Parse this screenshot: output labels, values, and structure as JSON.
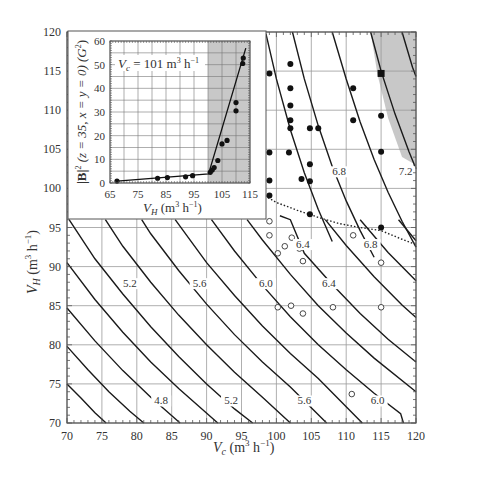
{
  "chart_data": [
    {
      "type": "line",
      "role": "main",
      "title": "",
      "xlabel": "V_c (m^3 h^-1)",
      "ylabel": "V_H (m^3 h^-1)",
      "xlim": [
        70,
        120
      ],
      "ylim": [
        70,
        120
      ],
      "xticks": [
        70,
        75,
        80,
        85,
        90,
        95,
        100,
        105,
        110,
        115,
        120
      ],
      "yticks": [
        70,
        75,
        80,
        85,
        90,
        95,
        100,
        105,
        110,
        115,
        120
      ],
      "grid": true,
      "contour_labels": [
        {
          "text": "4.8",
          "x": 83.5,
          "y": 72.5
        },
        {
          "text": "5.2",
          "x": 93.5,
          "y": 72.5
        },
        {
          "text": "5.6",
          "x": 104,
          "y": 72.5
        },
        {
          "text": "6.0",
          "x": 114.5,
          "y": 72.5
        },
        {
          "text": "5.2",
          "x": 79,
          "y": 87.5
        },
        {
          "text": "5.6",
          "x": 89,
          "y": 87.5
        },
        {
          "text": "6.0",
          "x": 98.5,
          "y": 87.5
        },
        {
          "text": "6.4",
          "x": 107.5,
          "y": 87.5
        },
        {
          "text": "6.4",
          "x": 103.8,
          "y": 92.5
        },
        {
          "text": "6.8",
          "x": 113.5,
          "y": 92.5
        },
        {
          "text": "6.8",
          "x": 109,
          "y": 101.8
        },
        {
          "text": "7.2",
          "x": 118.5,
          "y": 101.8
        }
      ],
      "contours": [
        [
          [
            70,
            75
          ],
          [
            72,
            73.2
          ],
          [
            74,
            71.3
          ],
          [
            75.6,
            70
          ]
        ],
        [
          [
            70,
            79.8
          ],
          [
            73,
            76.8
          ],
          [
            76,
            74
          ],
          [
            79,
            71.5
          ],
          [
            81,
            70
          ]
        ],
        [
          [
            70,
            84.7
          ],
          [
            74,
            80.5
          ],
          [
            78,
            76.7
          ],
          [
            82,
            73.3
          ],
          [
            86.2,
            70
          ]
        ],
        [
          [
            70,
            90.5
          ],
          [
            74,
            85.8
          ],
          [
            78,
            81.6
          ],
          [
            82,
            77.8
          ],
          [
            86,
            74.4
          ],
          [
            91.6,
            70
          ]
        ],
        [
          [
            70.3,
            96
          ],
          [
            74,
            91
          ],
          [
            78,
            86.5
          ],
          [
            82,
            82.3
          ],
          [
            86,
            78.5
          ],
          [
            90,
            75
          ],
          [
            94,
            71.8
          ],
          [
            96.6,
            70
          ]
        ],
        [
          [
            75.5,
            96
          ],
          [
            78,
            92.6
          ],
          [
            82,
            88
          ],
          [
            86,
            83.8
          ],
          [
            90,
            80
          ],
          [
            94,
            76.5
          ],
          [
            98,
            73.3
          ],
          [
            102,
            70
          ]
        ],
        [
          [
            80.7,
            96
          ],
          [
            82,
            94.2
          ],
          [
            86,
            89.5
          ],
          [
            90,
            85.2
          ],
          [
            94,
            81.3
          ],
          [
            98,
            77.8
          ],
          [
            102,
            74.6
          ],
          [
            107.2,
            70
          ]
        ],
        [
          [
            85.5,
            96
          ],
          [
            90,
            90.5
          ],
          [
            94,
            86.3
          ],
          [
            98,
            82.4
          ],
          [
            102,
            78.9
          ],
          [
            106,
            75.7
          ],
          [
            112.3,
            70
          ]
        ],
        [
          [
            90.7,
            96
          ],
          [
            94,
            92
          ],
          [
            98,
            87.6
          ],
          [
            102,
            83.6
          ],
          [
            106,
            80
          ],
          [
            110,
            76.8
          ],
          [
            114,
            73.8
          ],
          [
            117.8,
            71.2
          ],
          [
            118.2,
            70
          ]
        ],
        [
          [
            95.8,
            96
          ],
          [
            98,
            93.4
          ],
          [
            102,
            89
          ],
          [
            106,
            85
          ],
          [
            110,
            81.5
          ],
          [
            114,
            78.3
          ],
          [
            120,
            74
          ]
        ],
        [
          [
            100.5,
            96.5
          ],
          [
            102,
            96
          ],
          [
            104,
            91.7
          ],
          [
            108,
            87.7
          ],
          [
            112,
            84
          ],
          [
            116,
            80.7
          ],
          [
            120,
            77.8
          ]
        ],
        [
          [
            107,
            96
          ],
          [
            110,
            92.7
          ],
          [
            114,
            88.7
          ],
          [
            118,
            85.1
          ],
          [
            120,
            83.5
          ]
        ],
        [
          [
            112,
            96
          ],
          [
            116,
            91.8
          ],
          [
            120,
            88.2
          ]
        ],
        [
          [
            117.5,
            96
          ],
          [
            120,
            93.3
          ]
        ],
        [
          [
            98.5,
            119.8
          ],
          [
            100,
            114
          ],
          [
            102,
            107.5
          ],
          [
            104,
            102
          ],
          [
            106,
            97.3
          ],
          [
            108,
            93.2
          ]
        ],
        [
          [
            102.3,
            120
          ],
          [
            104,
            114
          ],
          [
            106,
            108
          ],
          [
            108,
            102.8
          ],
          [
            110,
            98.4
          ],
          [
            112,
            94.6
          ],
          [
            114,
            91.2
          ]
        ],
        [
          [
            108,
            120
          ],
          [
            110,
            114
          ],
          [
            112,
            108.5
          ],
          [
            114,
            103.7
          ],
          [
            116,
            99.5
          ],
          [
            118,
            95.8
          ],
          [
            120,
            92.5
          ]
        ],
        [
          [
            113.5,
            120
          ],
          [
            115,
            115
          ],
          [
            117,
            109.5
          ],
          [
            119,
            104.7
          ],
          [
            120,
            102.5
          ]
        ],
        [
          [
            118,
            120
          ],
          [
            119.5,
            115.5
          ],
          [
            120,
            114.3
          ]
        ]
      ],
      "dotted_boundary": [
        [
          97.5,
          99.5
        ],
        [
          100,
          98.2
        ],
        [
          103,
          97.2
        ],
        [
          106,
          96.3
        ],
        [
          109,
          95.5
        ],
        [
          112,
          95
        ],
        [
          115,
          94.6
        ],
        [
          118,
          93.5
        ],
        [
          120,
          92.8
        ]
      ],
      "shaded_region": [
        [
          113.5,
          120
        ],
        [
          120,
          120
        ],
        [
          120,
          103
        ],
        [
          118,
          104
        ],
        [
          116,
          109
        ],
        [
          114.5,
          114.5
        ]
      ],
      "filled_points": [
        [
          99,
          114.7
        ],
        [
          102,
          115.9
        ],
        [
          102,
          112.8
        ],
        [
          102,
          110.6
        ],
        [
          102,
          108.7
        ],
        [
          102,
          107.7
        ],
        [
          104.8,
          107.7
        ],
        [
          106,
          107.7
        ],
        [
          99,
          104.6
        ],
        [
          101.8,
          104.6
        ],
        [
          104.8,
          103.1
        ],
        [
          103.6,
          101.2
        ],
        [
          104.8,
          100.9
        ],
        [
          99,
          101
        ],
        [
          99,
          99.1
        ],
        [
          104.8,
          96.7
        ],
        [
          111,
          112.8
        ],
        [
          111,
          108.7
        ],
        [
          115,
          109.3
        ],
        [
          115,
          104.7
        ],
        [
          115,
          95
        ]
      ],
      "square_points": [
        [
          115,
          114.7
        ]
      ],
      "open_points": [
        [
          99,
          95.8
        ],
        [
          99,
          94
        ],
        [
          102.2,
          93.7
        ],
        [
          101.2,
          92.6
        ],
        [
          103.3,
          92.3
        ],
        [
          100.2,
          91.7
        ],
        [
          103.8,
          90.7
        ],
        [
          111,
          94
        ],
        [
          115,
          90.5
        ],
        [
          100.2,
          84.8
        ],
        [
          102.1,
          85
        ],
        [
          103.8,
          84
        ],
        [
          108.1,
          84.8
        ],
        [
          115,
          84.8
        ],
        [
          110.8,
          73.7
        ]
      ]
    },
    {
      "type": "scatter",
      "role": "inset",
      "title": "V_c = 101 m^3 h^-1",
      "xlabel": "V_H (m^3 h^-1)",
      "ylabel": "|B|^2 (z = 35, x = y = 0) (G^2)",
      "xlim": [
        65,
        115
      ],
      "ylim": [
        0,
        60
      ],
      "xticks": [
        65,
        75,
        85,
        95,
        105,
        115
      ],
      "yticks": [
        0,
        10,
        20,
        30,
        40,
        50,
        60
      ],
      "grid": true,
      "shaded_x_range": [
        100,
        115
      ],
      "fit_line": [
        [
          67.5,
          0.8
        ],
        [
          100.2,
          3.8
        ],
        [
          113.5,
          57
        ]
      ],
      "points": [
        [
          67.5,
          0.8
        ],
        [
          82,
          2
        ],
        [
          85.5,
          2.3
        ],
        [
          92,
          2.6
        ],
        [
          94.5,
          3.1
        ],
        [
          100.8,
          4.5
        ],
        [
          101.5,
          5.5
        ],
        [
          102.2,
          6.5
        ],
        [
          103.5,
          9.5
        ],
        [
          105,
          16.5
        ],
        [
          106.8,
          18
        ],
        [
          110,
          30.5
        ],
        [
          110,
          34
        ],
        [
          112.4,
          50.5
        ],
        [
          112.6,
          52.8
        ]
      ]
    }
  ],
  "main": {
    "xlabel_main": "V",
    "xlabel_sub": "c",
    "xlabel_units": " (m",
    "xlabel_exp": "3",
    "xlabel_h": " h",
    "xlabel_hexp": "−1",
    "xlabel_close": ")",
    "ylabel_main": "V",
    "ylabel_sub": "H",
    "ylabel_units": " (m",
    "ylabel_exp": "3",
    "ylabel_h": " h",
    "ylabel_hexp": "−1",
    "ylabel_close": ")"
  },
  "inset": {
    "annotation": "V",
    "annotation_sub": "c",
    "annotation_rest": " = 101 m",
    "annotation_exp": "3",
    "annotation_h": " h",
    "annotation_hexp": "−1",
    "xlabel_main": "V",
    "xlabel_sub": "H",
    "xlabel_units": " (m",
    "xlabel_exp": "3",
    "xlabel_h": " h",
    "xlabel_hexp": "−1",
    "xlabel_close": ")",
    "ylabel_text": "|B|",
    "ylabel_exp": "2",
    "ylabel_rest": " (z = 35, x = y = 0) (G",
    "ylabel_exp2": "2",
    "ylabel_close": ")"
  },
  "colors": {
    "shade": "#c8c8c8",
    "grid": "#9a9a9a",
    "curve": "#1a1a1a",
    "point": "#111111"
  }
}
